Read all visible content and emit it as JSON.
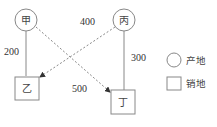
{
  "nodes": {
    "jia": {
      "label": "甲",
      "type": "产地"
    },
    "bing": {
      "label": "丙",
      "type": "产地"
    },
    "yi": {
      "label": "乙",
      "type": "销地"
    },
    "ding": {
      "label": "丁",
      "type": "销地"
    }
  },
  "edges": {
    "jia_yi": {
      "value": "200",
      "style": "solid"
    },
    "bing_ding": {
      "value": "300",
      "style": "solid"
    },
    "bing_yi": {
      "value": "400",
      "style": "dashed-arrow"
    },
    "jia_ding": {
      "value": "500",
      "style": "dashed-arrow"
    }
  },
  "legend": {
    "origin": "产地",
    "destination": "销地"
  },
  "colors": {
    "stroke": "#777777",
    "dash": "#888888",
    "text": "#333333"
  }
}
